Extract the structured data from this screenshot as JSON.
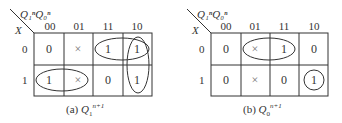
{
  "maps": [
    {
      "id": "a",
      "caption_prefix": "(a)",
      "caption_var": "Q",
      "caption_sub": "1",
      "caption_sup": "n+1",
      "col_var_label": "Q₁ⁿQ₀ⁿ",
      "row_var_label": "X",
      "col_headers": [
        "00",
        "01",
        "11",
        "10"
      ],
      "row_headers": [
        "0",
        "1"
      ],
      "cells": [
        [
          "0",
          "×",
          "1",
          "1"
        ],
        [
          "1",
          "×",
          "0",
          "1"
        ]
      ],
      "groupings": [
        {
          "shape": "ellipse",
          "covers": "row0 cols 11,10"
        },
        {
          "shape": "ellipse",
          "covers": "col 10 rows 0,1"
        },
        {
          "shape": "ellipse",
          "covers": "row1 cols 00,01"
        }
      ]
    },
    {
      "id": "b",
      "caption_prefix": "(b)",
      "caption_var": "Q",
      "caption_sub": "0",
      "caption_sup": "n+1",
      "col_var_label": "Q₁ⁿQ₀ⁿ",
      "row_var_label": "X",
      "col_headers": [
        "00",
        "01",
        "11",
        "10"
      ],
      "row_headers": [
        "0",
        "1"
      ],
      "cells": [
        [
          "0",
          "×",
          "1",
          "0"
        ],
        [
          "0",
          "×",
          "0",
          "1"
        ]
      ],
      "groupings": [
        {
          "shape": "ellipse",
          "covers": "row0 cols 01,11"
        },
        {
          "shape": "circle",
          "covers": "row1 col 10"
        }
      ]
    }
  ]
}
